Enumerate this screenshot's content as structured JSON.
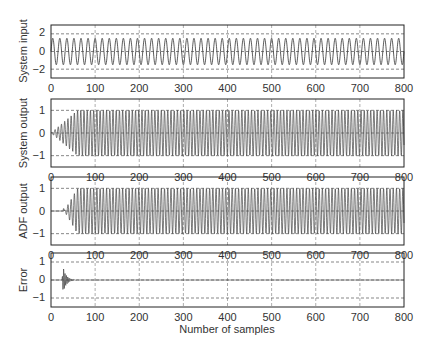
{
  "chart_data": [
    {
      "type": "line",
      "title": "",
      "ylabel": "System input",
      "xlabel": "",
      "xlim": [
        0,
        800
      ],
      "ylim": [
        -3,
        3
      ],
      "xticks": [
        0,
        100,
        200,
        300,
        400,
        500,
        600,
        700,
        800
      ],
      "yticks": [
        -2,
        0,
        2
      ],
      "grid": true,
      "series": [
        {
          "name": "System input",
          "description": "Sinusoid amplitude ~1.5, constant envelope",
          "amplitude": 1.5,
          "period_samples": 16,
          "start": 0
        }
      ]
    },
    {
      "type": "line",
      "title": "",
      "ylabel": "System output",
      "xlabel": "",
      "xlim": [
        0,
        800
      ],
      "ylim": [
        -1.5,
        1.5
      ],
      "xticks": [
        0,
        100,
        200,
        300,
        400,
        500,
        600,
        700,
        800
      ],
      "yticks": [
        -1,
        0,
        1
      ],
      "grid": true,
      "series": [
        {
          "name": "System output",
          "description": "Oscillation ramping from 0 to ~1 by sample ~60, then constant",
          "amplitude": 1.0,
          "ramp_end": 60,
          "start": 0
        }
      ]
    },
    {
      "type": "line",
      "title": "",
      "ylabel": "ADF output",
      "xlabel": "",
      "xlim": [
        0,
        800
      ],
      "ylim": [
        -1.5,
        1.5
      ],
      "xticks": [
        0,
        100,
        200,
        300,
        400,
        500,
        600,
        700,
        800
      ],
      "yticks": [
        -1,
        0,
        1
      ],
      "grid": true,
      "series": [
        {
          "name": "ADF output",
          "description": "Zero until ~30, then ramps to ~1 by ~60, constant after",
          "amplitude": 1.0,
          "start": 30,
          "ramp_end": 60
        }
      ]
    },
    {
      "type": "line",
      "title": "",
      "ylabel": "Error",
      "xlabel": "Number of samples",
      "xlim": [
        0,
        800
      ],
      "ylim": [
        -1.5,
        1.5
      ],
      "xticks": [
        0,
        100,
        200,
        300,
        400,
        500,
        600,
        700,
        800
      ],
      "yticks": [
        -1,
        0,
        1
      ],
      "grid": true,
      "series": [
        {
          "name": "Error",
          "description": "Burst near samples 25-60 peaking ~0.7, decaying to 0",
          "peak": 0.7,
          "start": 25,
          "end": 60
        }
      ]
    }
  ],
  "panels": [
    {
      "ylabel": "System input",
      "yticks": [
        "2",
        "0",
        "−2"
      ]
    },
    {
      "ylabel": "System output",
      "yticks": [
        "1",
        "0",
        "−1"
      ]
    },
    {
      "ylabel": "ADF output",
      "yticks": [
        "1",
        "0",
        "−1"
      ]
    },
    {
      "ylabel": "Error",
      "yticks": [
        "1",
        "0",
        "−1"
      ]
    }
  ],
  "xticks": [
    "0",
    "100",
    "200",
    "300",
    "400",
    "500",
    "600",
    "700",
    "800"
  ],
  "xlabel": "Number of samples"
}
